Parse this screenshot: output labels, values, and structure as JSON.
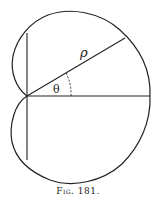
{
  "figure": {
    "caption": "Fig. 181.",
    "labels": {
      "radius": "ρ",
      "angle": "θ"
    },
    "curve": "cardioid-like closed curve with cusp at origin",
    "colors": {
      "stroke": "#222222",
      "background": "#ffffff"
    }
  }
}
